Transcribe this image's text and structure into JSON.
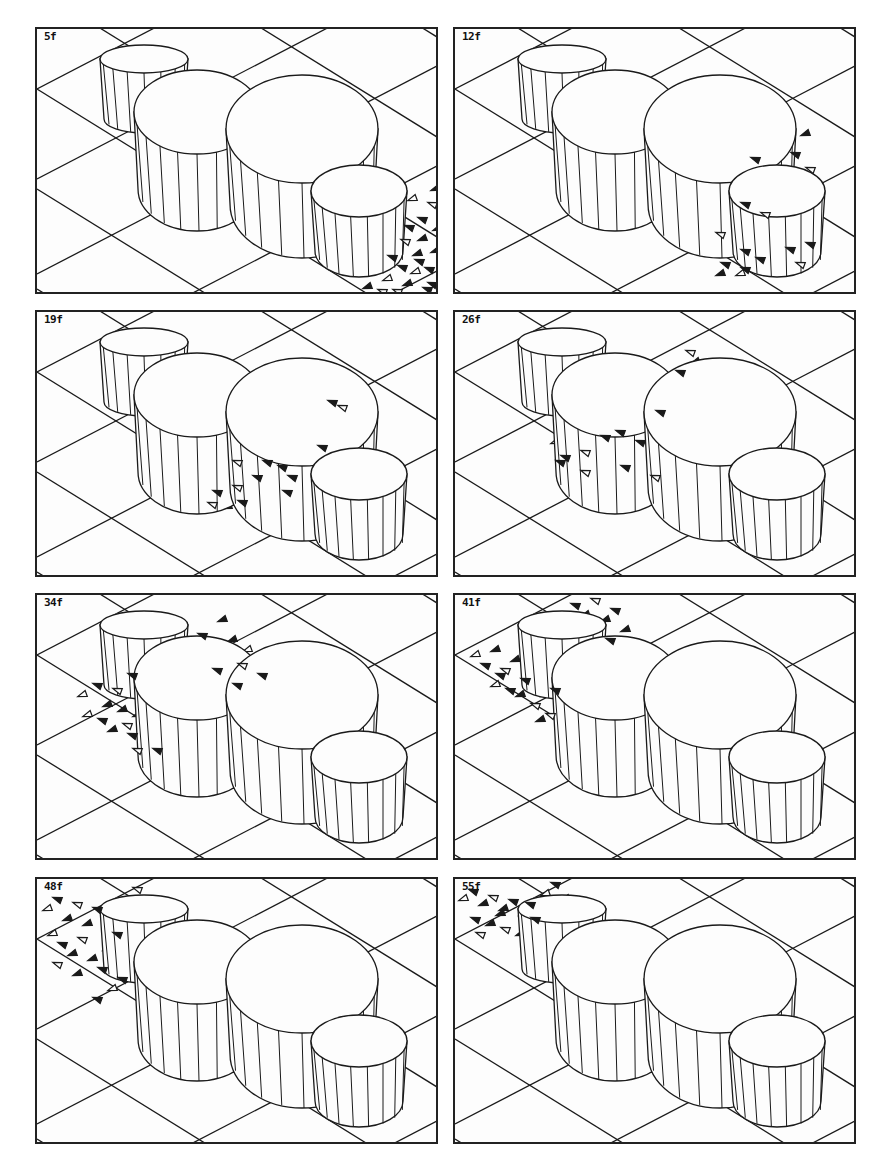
{
  "figure": {
    "colors": {
      "line": "#1a1a1a",
      "background": "#fdfdfd"
    },
    "panels": [
      {
        "label": "5f",
        "row": 0,
        "col": 0,
        "flock": [
          [
            360,
            185
          ],
          [
            372,
            198
          ],
          [
            385,
            210
          ],
          [
            395,
            175
          ],
          [
            380,
            225
          ],
          [
            365,
            238
          ],
          [
            350,
            250
          ],
          [
            392,
            240
          ],
          [
            370,
            255
          ],
          [
            345,
            262
          ],
          [
            400,
            200
          ],
          [
            390,
            260
          ],
          [
            378,
            243
          ],
          [
            355,
            228
          ],
          [
            398,
            222
          ],
          [
            368,
            212
          ],
          [
            340,
            240
          ],
          [
            385,
            190
          ],
          [
            375,
            170
          ],
          [
            395,
            255
          ],
          [
            330,
            258
          ],
          [
            360,
            262
          ],
          [
            398,
            160
          ],
          [
            382,
            232
          ]
        ]
      },
      {
        "label": "12f",
        "row": 0,
        "col": 1,
        "flock": [
          [
            280,
            190
          ],
          [
            290,
            175
          ],
          [
            300,
            200
          ],
          [
            310,
            185
          ],
          [
            320,
            210
          ],
          [
            335,
            220
          ],
          [
            345,
            200
          ],
          [
            355,
            215
          ],
          [
            300,
            215
          ],
          [
            265,
            205
          ],
          [
            250,
            225
          ],
          [
            270,
            235
          ],
          [
            285,
            245
          ],
          [
            305,
            230
          ],
          [
            320,
            240
          ],
          [
            345,
            235
          ],
          [
            265,
            245
          ],
          [
            290,
            222
          ],
          [
            330,
            110
          ],
          [
            340,
            125
          ],
          [
            350,
            105
          ],
          [
            355,
            140
          ],
          [
            325,
            140
          ],
          [
            300,
            130
          ],
          [
            340,
            150
          ],
          [
            290,
            240
          ],
          [
            330,
            190
          ]
        ]
      },
      {
        "label": "19f",
        "row": 1,
        "col": 0,
        "flock": [
          [
            170,
            170
          ],
          [
            180,
            180
          ],
          [
            190,
            160
          ],
          [
            200,
            175
          ],
          [
            210,
            185
          ],
          [
            220,
            165
          ],
          [
            235,
            170
          ],
          [
            245,
            155
          ],
          [
            160,
            185
          ],
          [
            175,
            192
          ],
          [
            190,
            195
          ],
          [
            205,
            190
          ],
          [
            215,
            180
          ],
          [
            230,
            150
          ],
          [
            215,
            140
          ],
          [
            200,
            150
          ],
          [
            240,
            140
          ],
          [
            255,
            165
          ],
          [
            270,
            120
          ],
          [
            285,
            135
          ],
          [
            300,
            110
          ],
          [
            305,
            95
          ],
          [
            290,
            75
          ],
          [
            295,
            90
          ],
          [
            310,
            125
          ],
          [
            250,
            180
          ],
          [
            265,
            150
          ]
        ]
      },
      {
        "label": "26f",
        "row": 1,
        "col": 1,
        "flock": [
          [
            100,
            130
          ],
          [
            110,
            145
          ],
          [
            120,
            120
          ],
          [
            130,
            140
          ],
          [
            140,
            150
          ],
          [
            150,
            125
          ],
          [
            160,
            140
          ],
          [
            170,
            155
          ],
          [
            115,
            160
          ],
          [
            130,
            160
          ],
          [
            150,
            160
          ],
          [
            165,
            120
          ],
          [
            175,
            110
          ],
          [
            185,
            130
          ],
          [
            195,
            150
          ],
          [
            200,
            165
          ],
          [
            180,
            95
          ],
          [
            205,
            100
          ],
          [
            210,
            75
          ],
          [
            225,
            60
          ],
          [
            240,
            50
          ],
          [
            235,
            40
          ],
          [
            220,
            80
          ],
          [
            105,
            150
          ],
          [
            145,
            110
          ]
        ]
      },
      {
        "label": "34f",
        "row": 2,
        "col": 0,
        "flock": [
          [
            45,
            100
          ],
          [
            60,
            90
          ],
          [
            70,
            110
          ],
          [
            80,
            95
          ],
          [
            85,
            115
          ],
          [
            95,
            80
          ],
          [
            50,
            120
          ],
          [
            65,
            125
          ],
          [
            75,
            135
          ],
          [
            90,
            130
          ],
          [
            100,
            120
          ],
          [
            95,
            140
          ],
          [
            110,
            160
          ],
          [
            120,
            155
          ],
          [
            130,
            165
          ],
          [
            100,
            155
          ],
          [
            150,
            50
          ],
          [
            165,
            40
          ],
          [
            175,
            60
          ],
          [
            180,
            75
          ],
          [
            195,
            45
          ],
          [
            205,
            70
          ],
          [
            185,
            25
          ],
          [
            200,
            90
          ],
          [
            210,
            55
          ],
          [
            225,
            80
          ]
        ]
      },
      {
        "label": "41f",
        "row": 2,
        "col": 1,
        "flock": [
          [
            20,
            60
          ],
          [
            30,
            70
          ],
          [
            40,
            55
          ],
          [
            50,
            75
          ],
          [
            60,
            65
          ],
          [
            70,
            85
          ],
          [
            40,
            90
          ],
          [
            55,
            95
          ],
          [
            65,
            100
          ],
          [
            80,
            110
          ],
          [
            90,
            100
          ],
          [
            100,
            95
          ],
          [
            110,
            85
          ],
          [
            120,
            10
          ],
          [
            130,
            20
          ],
          [
            140,
            5
          ],
          [
            150,
            25
          ],
          [
            160,
            15
          ],
          [
            135,
            40
          ],
          [
            155,
            45
          ],
          [
            170,
            35
          ],
          [
            95,
            120
          ],
          [
            85,
            125
          ],
          [
            45,
            80
          ]
        ]
      },
      {
        "label": "48f",
        "row": 3,
        "col": 0,
        "flock": [
          [
            10,
            30
          ],
          [
            20,
            20
          ],
          [
            30,
            40
          ],
          [
            40,
            25
          ],
          [
            50,
            45
          ],
          [
            60,
            30
          ],
          [
            15,
            55
          ],
          [
            25,
            65
          ],
          [
            35,
            75
          ],
          [
            45,
            60
          ],
          [
            55,
            80
          ],
          [
            65,
            90
          ],
          [
            70,
            70
          ],
          [
            80,
            55
          ],
          [
            90,
            25
          ],
          [
            100,
            10
          ],
          [
            110,
            30
          ],
          [
            85,
            100
          ],
          [
            75,
            110
          ],
          [
            60,
            120
          ],
          [
            40,
            95
          ],
          [
            20,
            85
          ]
        ]
      },
      {
        "label": "55f",
        "row": 3,
        "col": 1,
        "flock": [
          [
            8,
            20
          ],
          [
            18,
            12
          ],
          [
            28,
            25
          ],
          [
            38,
            18
          ],
          [
            48,
            30
          ],
          [
            58,
            22
          ],
          [
            68,
            35
          ],
          [
            20,
            40
          ],
          [
            35,
            45
          ],
          [
            50,
            50
          ],
          [
            65,
            55
          ],
          [
            80,
            40
          ],
          [
            90,
            15
          ],
          [
            100,
            5
          ],
          [
            110,
            20
          ],
          [
            25,
            55
          ],
          [
            45,
            35
          ],
          [
            75,
            25
          ]
        ]
      }
    ]
  }
}
